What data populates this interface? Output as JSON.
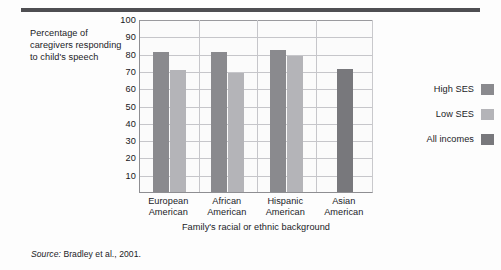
{
  "figure": {
    "y_axis_caption": "Percentage of caregivers responding to child's speech",
    "x_axis_title": "Family's racial or ethnic background",
    "source_prefix": "Source:",
    "source_text": "Bradley et al., 2001."
  },
  "legend": {
    "items": [
      {
        "label": "High SES",
        "color": "#8a8a8e"
      },
      {
        "label": "Low SES",
        "color": "#b4b4b8"
      },
      {
        "label": "All incomes",
        "color": "#78787c"
      }
    ]
  },
  "colors": {
    "high_ses": "#8a8a8e",
    "low_ses": "#b4b4b8",
    "all_incomes": "#78787c",
    "grid": "#c6c6ca",
    "axis": "#8e8e92",
    "rule": "#4e4e52",
    "text": "#1b1b1f",
    "plot_bg": "#fbfbfb"
  },
  "chart_data": {
    "type": "bar",
    "title": "",
    "xlabel": "Family's racial or ethnic background",
    "ylabel": "Percentage of caregivers responding to child's speech",
    "ylim": [
      0,
      100
    ],
    "yticks": [
      10,
      20,
      30,
      40,
      50,
      60,
      70,
      80,
      90,
      100
    ],
    "ytick_labels": [
      "10",
      "20",
      "30",
      "40",
      "50",
      "60",
      "70",
      "80",
      "90",
      "100"
    ],
    "grid": "horizontal-and-group-separators",
    "legend_position": "right",
    "categories": [
      "European American",
      "African American",
      "Hispanic American",
      "Asian American"
    ],
    "category_lines": [
      [
        "European",
        "American"
      ],
      [
        "African",
        "American"
      ],
      [
        "Hispanic",
        "American"
      ],
      [
        "Asian",
        "American"
      ]
    ],
    "series": [
      {
        "name": "High SES",
        "color": "#8a8a8e",
        "values": [
          81,
          81,
          82,
          null
        ]
      },
      {
        "name": "Low SES",
        "color": "#b4b4b8",
        "values": [
          70.5,
          69,
          78.5,
          null
        ]
      },
      {
        "name": "All incomes",
        "color": "#78787c",
        "values": [
          null,
          null,
          null,
          71
        ]
      }
    ]
  }
}
